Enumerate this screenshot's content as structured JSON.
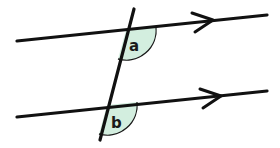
{
  "diagram": {
    "type": "parallel-lines-transversal",
    "colors": {
      "line": "#111111",
      "angle_fill": "#d3eedf",
      "angle_stroke": "#1a1a1a",
      "background": "#ffffff"
    },
    "lines": {
      "top": {
        "x1": 17,
        "y1": 41,
        "x2": 267,
        "y2": 15,
        "arrow_tip": [
          213,
          20
        ]
      },
      "bottom": {
        "x1": 17,
        "y1": 117,
        "x2": 267,
        "y2": 91,
        "arrow_tip": [
          221,
          96
        ]
      },
      "transversal": {
        "x1": 134,
        "y1": 9,
        "x2": 100,
        "y2": 140
      }
    },
    "angles": [
      {
        "id": "a",
        "label": "a",
        "vertex": [
          126,
          30
        ]
      },
      {
        "id": "b",
        "label": "b",
        "vertex": [
          107,
          105
        ]
      }
    ]
  }
}
